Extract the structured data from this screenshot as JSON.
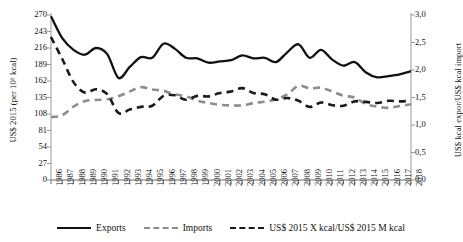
{
  "chart_data": {
    "type": "line",
    "title": "",
    "xlabel": "",
    "ylabel": "US$ 2015 (per 10⁶ kcal)",
    "ylabel_right": "US$ kcal expor/US$ kcal import",
    "grid": false,
    "legend_position": "bottom",
    "ylim": [
      0,
      270
    ],
    "yticks": [
      "0",
      "27",
      "54",
      "81",
      "108",
      "135",
      "162",
      "189",
      "216",
      "243",
      "270"
    ],
    "ylim_right": [
      0,
      3.0
    ],
    "yticks_right": [
      "0,0",
      "0,5",
      "1,0",
      "1,5",
      "2,0",
      "2,5",
      "3,0"
    ],
    "categories": [
      "1986",
      "1987",
      "1988",
      "1989",
      "1990",
      "1991",
      "1992",
      "1993",
      "1994",
      "1995",
      "1996",
      "1997",
      "1998",
      "1999",
      "2000",
      "2001",
      "2002",
      "2003",
      "2004",
      "2005",
      "2006",
      "2007",
      "2008",
      "2009",
      "2010",
      "2011",
      "2012",
      "2013",
      "2014",
      "2015",
      "2016",
      "2017",
      "2018"
    ],
    "series": [
      {
        "name": "Exports",
        "axis": "left",
        "style": "solid",
        "color": "#111111",
        "values": [
          268,
          232,
          213,
          205,
          216,
          206,
          167,
          185,
          201,
          200,
          223,
          215,
          200,
          199,
          192,
          194,
          196,
          204,
          199,
          200,
          193,
          209,
          222,
          200,
          213,
          197,
          187,
          193,
          176,
          168,
          170,
          173,
          178
        ]
      },
      {
        "name": "Imports",
        "axis": "left",
        "style": "dashed",
        "color": "#8d8d8d",
        "values": [
          103,
          106,
          120,
          129,
          131,
          132,
          137,
          145,
          152,
          148,
          146,
          140,
          137,
          130,
          126,
          123,
          122,
          122,
          126,
          128,
          132,
          140,
          154,
          150,
          151,
          145,
          138,
          135,
          124,
          120,
          118,
          121,
          124
        ]
      },
      {
        "name": "US$ 2015 X kcal/US$ 2015 M kcal",
        "axis": "right",
        "style": "dashed",
        "color": "#1a1a1a",
        "values": [
          2.6,
          2.2,
          1.78,
          1.59,
          1.65,
          1.56,
          1.22,
          1.28,
          1.33,
          1.35,
          1.53,
          1.54,
          1.46,
          1.53,
          1.52,
          1.58,
          1.61,
          1.67,
          1.58,
          1.56,
          1.46,
          1.49,
          1.44,
          1.33,
          1.41,
          1.36,
          1.35,
          1.43,
          1.42,
          1.4,
          1.44,
          1.43,
          1.44
        ]
      }
    ]
  },
  "legend": {
    "items": [
      {
        "label": "Exports"
      },
      {
        "label": "Imports"
      },
      {
        "label": "US$ 2015 X kcal/US$ 2015 M kcal"
      }
    ]
  }
}
